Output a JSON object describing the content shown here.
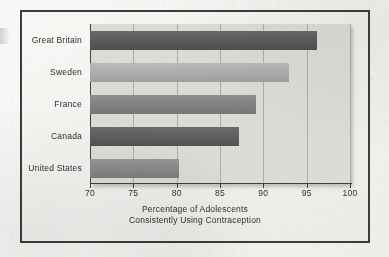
{
  "chart_data": {
    "type": "bar",
    "orientation": "horizontal",
    "title": "",
    "xlabel": "Percentage of Adolescents Consistently Using Contraception",
    "xlabel_lines": [
      "Percentage of Adolescents",
      "Consistently Using Contraception"
    ],
    "ylabel": "",
    "categories": [
      "Great Britain",
      "Sweden",
      "France",
      "Canada",
      "United States"
    ],
    "values": [
      96.2,
      93.0,
      89.1,
      87.2,
      80.3
    ],
    "xlim": [
      70,
      100
    ],
    "xticks": [
      70,
      75,
      80,
      85,
      90,
      95,
      100
    ],
    "xtick_labels": [
      "70",
      "75",
      "80",
      "85",
      "90",
      "95",
      "100"
    ],
    "grid": "vertical",
    "legend": "none",
    "bar_colors": [
      "#575757",
      "#b2b2b2",
      "#828282",
      "#5b5b5b",
      "#8a8a8a"
    ]
  },
  "figure": {
    "panel_background": "#dcdbd6",
    "page_background": "#f3f2ef",
    "frame_color": "#3c3c3c",
    "gridline_color": "#adaca7",
    "axis_color": "#3f3f3f",
    "text_color": "#2e2e2e"
  }
}
